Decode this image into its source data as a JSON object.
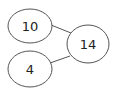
{
  "diagram": {
    "type": "number-bond",
    "colors": {
      "stroke": "#555555",
      "text": "#222222",
      "background": "#ffffff"
    },
    "parts": [
      {
        "label": "10",
        "cx": 30,
        "cy": 26,
        "rx": 22,
        "ry": 17
      },
      {
        "label": "4",
        "cx": 30,
        "cy": 69,
        "rx": 22,
        "ry": 18
      }
    ],
    "whole": {
      "label": "14",
      "cx": 88,
      "cy": 44,
      "rx": 21,
      "ry": 19
    },
    "connectors": [
      {
        "x1": 51,
        "y1": 25,
        "x2": 71,
        "y2": 33
      },
      {
        "x1": 50,
        "y1": 63,
        "x2": 70,
        "y2": 56
      }
    ]
  }
}
